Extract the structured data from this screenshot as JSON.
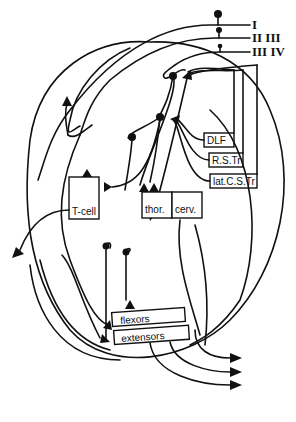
{
  "diagram": {
    "type": "neural-circuit-schematic",
    "stroke_color": "#111111",
    "background": "#ffffff"
  },
  "afferents": [
    {
      "label": "I"
    },
    {
      "label": "II  III"
    },
    {
      "label": "III  IV"
    }
  ],
  "tracts": [
    {
      "label": "DLF"
    },
    {
      "label": "R.S.Tr"
    },
    {
      "label": "lat.C.S.Tr"
    }
  ],
  "cells": {
    "tcell": {
      "label": "T-cell"
    },
    "thor": {
      "label": "thor."
    },
    "cerv": {
      "label": "cerv."
    }
  },
  "motor_pools": [
    {
      "label": "flexors"
    },
    {
      "label": "extensors"
    }
  ]
}
